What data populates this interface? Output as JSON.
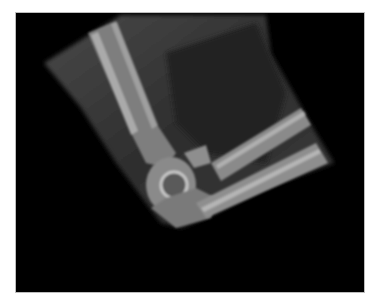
{
  "image": {
    "subject": "elbow radiograph",
    "description": "Lateral X-ray of a flexed elbow showing humerus, radius and ulna on a black background",
    "colors": {
      "background": "#000000",
      "border": "#ffffff",
      "soft_tissue": "#3a3a3a",
      "bone": "#9a9a9a",
      "bone_highlight": "#c8c8c8"
    }
  }
}
